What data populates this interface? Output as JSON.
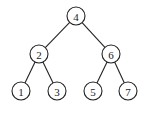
{
  "diagram": {
    "type": "binary-search-tree",
    "nodes": [
      {
        "id": "n4",
        "label": "4",
        "x": 76,
        "y": 16
      },
      {
        "id": "n2",
        "label": "2",
        "x": 39,
        "y": 54
      },
      {
        "id": "n6",
        "label": "6",
        "x": 111,
        "y": 54
      },
      {
        "id": "n1",
        "label": "1",
        "x": 21,
        "y": 91
      },
      {
        "id": "n3",
        "label": "3",
        "x": 57,
        "y": 91
      },
      {
        "id": "n5",
        "label": "5",
        "x": 93,
        "y": 91
      },
      {
        "id": "n7",
        "label": "7",
        "x": 128,
        "y": 91
      }
    ],
    "edges": [
      [
        "n4",
        "n2"
      ],
      [
        "n4",
        "n6"
      ],
      [
        "n2",
        "n1"
      ],
      [
        "n2",
        "n3"
      ],
      [
        "n6",
        "n5"
      ],
      [
        "n6",
        "n7"
      ]
    ],
    "radius": 9
  }
}
